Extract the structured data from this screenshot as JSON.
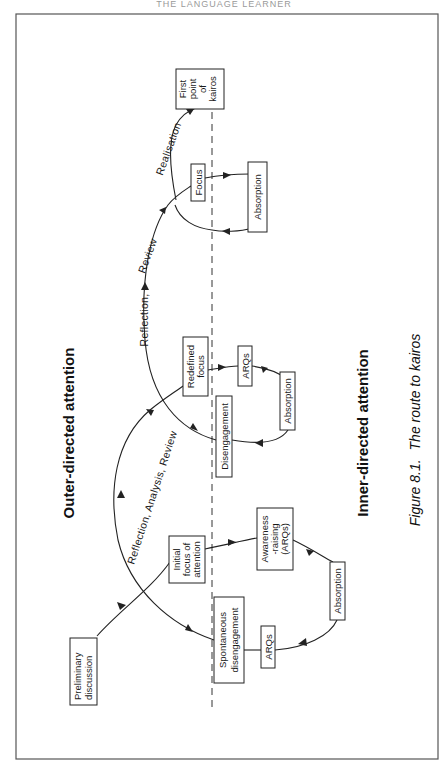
{
  "page": {
    "running_header": "THE LANGUAGE LEARNER"
  },
  "diagram": {
    "regions": {
      "outer": "Outer-directed attention",
      "inner": "Inner-directed attention"
    },
    "caption": {
      "figure": "Figure 8.1.",
      "title": "The route to kairos"
    },
    "nodes": {
      "preliminary": [
        "Preliminary",
        "discussion"
      ],
      "initial_focus": [
        "Initial",
        "focus of",
        "attention"
      ],
      "awareness": [
        "Awareness",
        "-raising",
        "(ARQs)"
      ],
      "absorption_1": [
        "Absorption"
      ],
      "arqs_1": [
        "ARQs"
      ],
      "spontaneous": [
        "Spontaneous",
        "disengagement"
      ],
      "redefined_focus": [
        "Redefined",
        "focus"
      ],
      "arqs_2": [
        "ARQs"
      ],
      "absorption_2": [
        "Absorption"
      ],
      "disengagement": [
        "Disengagement"
      ],
      "focus": [
        "Focus"
      ],
      "absorption_3": [
        "Absorption"
      ],
      "kairos": [
        "First",
        "point",
        "of",
        "kairos"
      ]
    },
    "path_labels": {
      "arc_1": "Reflection,  Analysis,  Review",
      "arc_2": "Reflection,",
      "arc_2b": "Review",
      "arc_3": "Realisation"
    },
    "colors": {
      "line": "#222222",
      "frame": "#555555",
      "background": "#ffffff"
    }
  }
}
